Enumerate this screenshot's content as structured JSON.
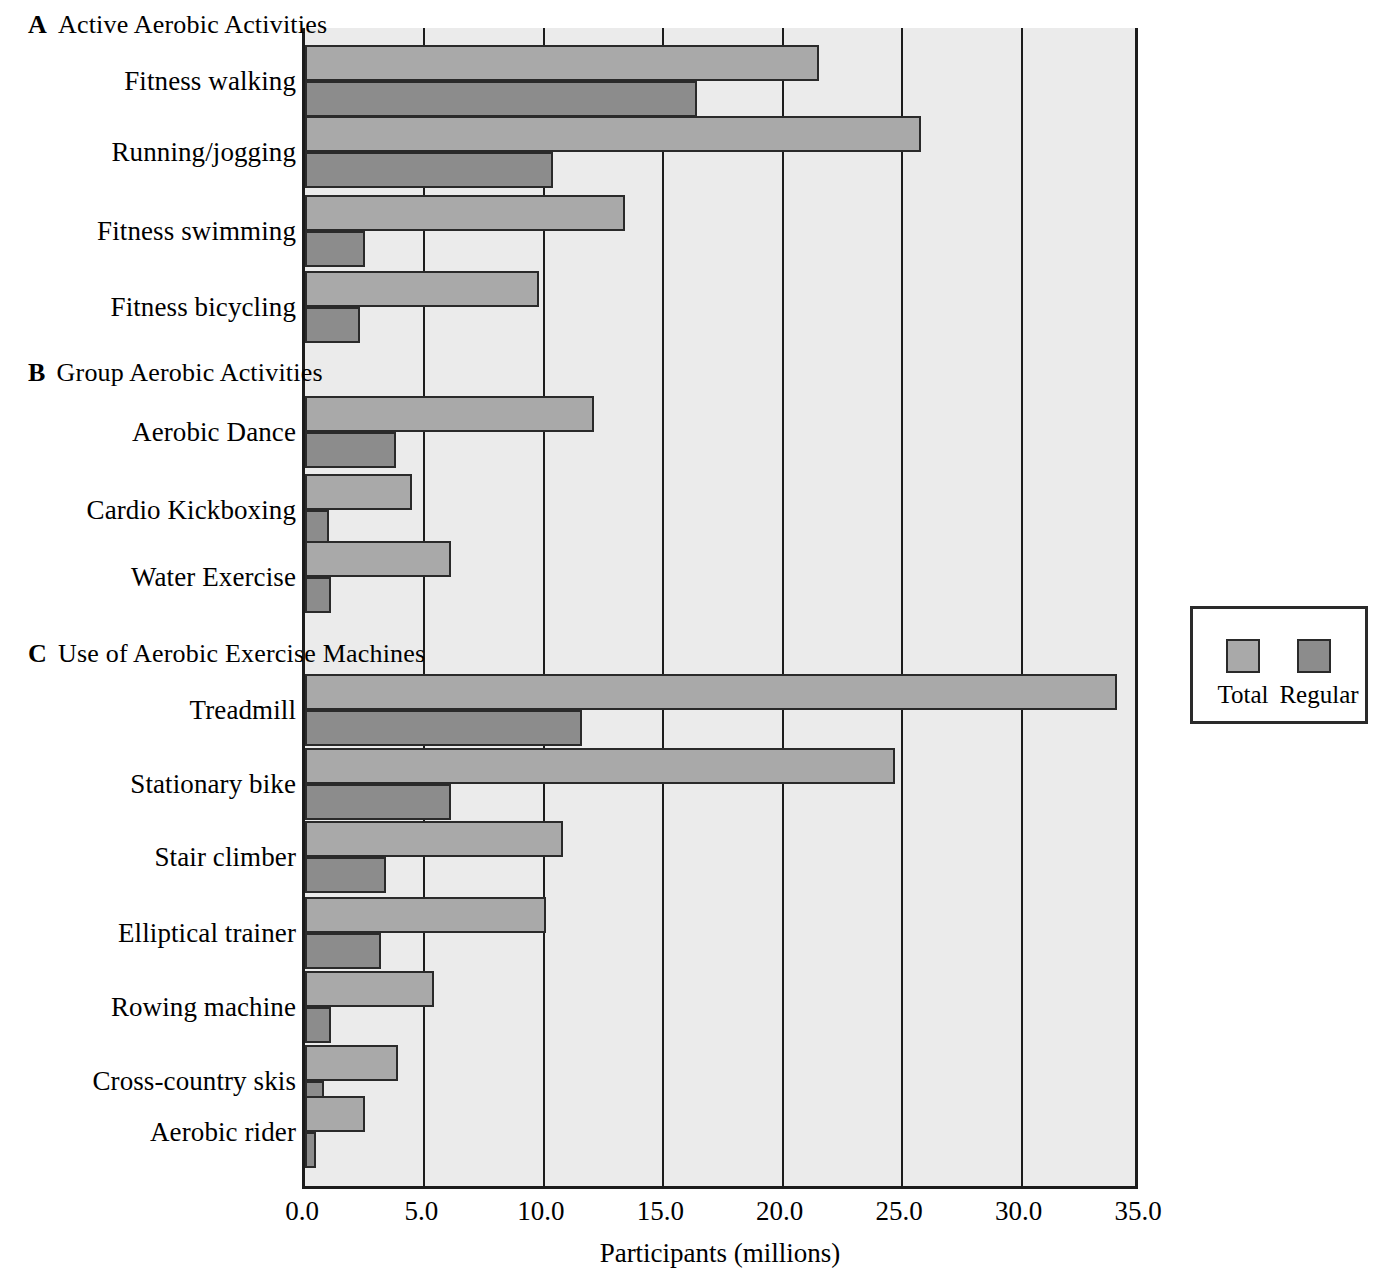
{
  "chart_data": {
    "type": "bar",
    "orientation": "horizontal",
    "title": "",
    "xlabel": "Participants (millions)",
    "ylabel": "",
    "xlim": [
      0.0,
      35.0
    ],
    "xticks": [
      "0.0",
      "5.0",
      "10.0",
      "15.0",
      "20.0",
      "25.0",
      "30.0",
      "35.0"
    ],
    "xtick_values": [
      0,
      5,
      10,
      15,
      20,
      25,
      30,
      35
    ],
    "grid": "vertical gridlines at every x tick",
    "legend": {
      "position": "right, outside plot, boxed",
      "entries": [
        {
          "name": "Total",
          "color": "#a9a9a9"
        },
        {
          "name": "Regular",
          "color": "#8c8c8c"
        }
      ]
    },
    "series": [
      {
        "name": "Total",
        "color": "#a9a9a9"
      },
      {
        "name": "Regular",
        "color": "#8c8c8c"
      }
    ],
    "panels": [
      {
        "letter": "A",
        "title": "Active Aerobic Activities",
        "categories": [
          "Fitness walking",
          "Running/jogging",
          "Fitness swimming",
          "Fitness bicycling"
        ],
        "values": {
          "Total": [
            21.5,
            25.8,
            13.4,
            9.8
          ],
          "Regular": [
            16.4,
            10.4,
            2.5,
            2.3
          ]
        }
      },
      {
        "letter": "B",
        "title": "Group Aerobic Activities",
        "categories": [
          "Aerobic Dance",
          "Cardio Kickboxing",
          "Water Exercise"
        ],
        "values": {
          "Total": [
            12.1,
            4.5,
            6.1
          ],
          "Regular": [
            3.8,
            1.0,
            1.1
          ]
        }
      },
      {
        "letter": "C",
        "title": "Use of Aerobic Exercise Machines",
        "categories": [
          "Treadmill",
          "Stationary bike",
          "Stair climber",
          "Elliptical trainer",
          "Rowing machine",
          "Cross-country skis",
          "Aerobic rider"
        ],
        "values": {
          "Total": [
            34.0,
            24.7,
            10.8,
            10.1,
            5.4,
            3.9,
            2.5
          ],
          "Regular": [
            11.6,
            6.1,
            3.4,
            3.2,
            1.1,
            0.8,
            0.45
          ]
        }
      }
    ]
  },
  "xaxis": {
    "title": "Participants (millions)",
    "ticks": [
      "0.0",
      "5.0",
      "10.0",
      "15.0",
      "20.0",
      "25.0",
      "30.0",
      "35.0"
    ]
  },
  "legend": {
    "total_label": "Total",
    "regular_label": "Regular"
  },
  "panels": {
    "a": {
      "letter": "A",
      "title": "Active Aerobic Activities"
    },
    "b": {
      "letter": "B",
      "title": "Group Aerobic Activities"
    },
    "c": {
      "letter": "C",
      "title": "Use of Aerobic Exercise Machines"
    }
  },
  "colors": {
    "total": "#a9a9a9",
    "regular": "#8c8c8c",
    "plot_background": "#ebebeb",
    "axis": "#1c1c1c"
  }
}
